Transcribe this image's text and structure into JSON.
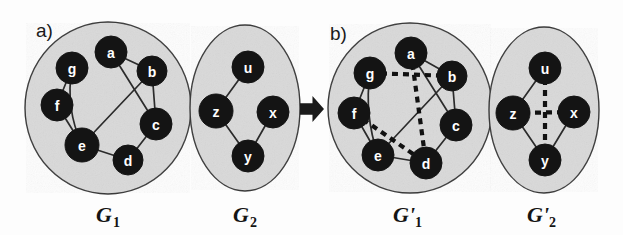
{
  "figure": {
    "panels": [
      {
        "id": "a",
        "letter": "a)"
      },
      {
        "id": "b",
        "letter": "b)"
      }
    ],
    "transition_arrow": "right-arrow",
    "colors": {
      "node_fill": "#141414",
      "node_label": "#ffffff",
      "container_fill": "#d9d9d9",
      "container_stroke": "#3a3a3a",
      "solid_edge": "#2b2b2b",
      "dashed_edge": "#111111",
      "background": "#fdfdfd"
    }
  },
  "graphs": [
    {
      "key": "G1",
      "label_main": "G",
      "label_sub": "1",
      "panel": "a",
      "container": {
        "cx": 108,
        "cy": 108,
        "rx": 83,
        "ry": 86
      },
      "label_pos": {
        "x": 96,
        "y": 222
      },
      "nodes": [
        {
          "id": "a",
          "x": 111,
          "y": 52,
          "r": 16
        },
        {
          "id": "b",
          "x": 152,
          "y": 71,
          "r": 15
        },
        {
          "id": "c",
          "x": 156,
          "y": 124,
          "r": 16
        },
        {
          "id": "d",
          "x": 128,
          "y": 160,
          "r": 15
        },
        {
          "id": "e",
          "x": 82,
          "y": 145,
          "r": 17
        },
        {
          "id": "f",
          "x": 57,
          "y": 105,
          "r": 16
        },
        {
          "id": "g",
          "x": 72,
          "y": 68,
          "r": 16
        }
      ],
      "edges": [
        {
          "from": "g",
          "to": "f",
          "style": "solid"
        },
        {
          "from": "g",
          "to": "e",
          "style": "solid",
          "curve": 12
        },
        {
          "from": "f",
          "to": "e",
          "style": "solid"
        },
        {
          "from": "a",
          "to": "b",
          "style": "solid"
        },
        {
          "from": "a",
          "to": "c",
          "style": "solid"
        },
        {
          "from": "b",
          "to": "c",
          "style": "solid"
        },
        {
          "from": "b",
          "to": "e",
          "style": "solid"
        },
        {
          "from": "c",
          "to": "d",
          "style": "solid"
        },
        {
          "from": "e",
          "to": "d",
          "style": "solid"
        }
      ]
    },
    {
      "key": "G2",
      "label_main": "G",
      "label_sub": "2",
      "panel": "a",
      "container": {
        "cx": 245,
        "cy": 108,
        "rx": 55,
        "ry": 83
      },
      "label_pos": {
        "x": 233,
        "y": 222
      },
      "nodes": [
        {
          "id": "u",
          "x": 248,
          "y": 67,
          "r": 16
        },
        {
          "id": "z",
          "x": 216,
          "y": 111,
          "r": 17
        },
        {
          "id": "x",
          "x": 273,
          "y": 112,
          "r": 16
        },
        {
          "id": "y",
          "x": 248,
          "y": 156,
          "r": 16
        }
      ],
      "edges": [
        {
          "from": "z",
          "to": "u",
          "style": "solid"
        },
        {
          "from": "z",
          "to": "y",
          "style": "solid"
        },
        {
          "from": "x",
          "to": "y",
          "style": "solid"
        }
      ]
    },
    {
      "key": "G1prime",
      "label_main": "G'",
      "label_sub": "1",
      "panel": "b",
      "container": {
        "cx": 410,
        "cy": 108,
        "rx": 82,
        "ry": 85
      },
      "label_pos": {
        "x": 393,
        "y": 222
      },
      "nodes": [
        {
          "id": "a",
          "x": 411,
          "y": 53,
          "r": 16
        },
        {
          "id": "b",
          "x": 452,
          "y": 76,
          "r": 15
        },
        {
          "id": "c",
          "x": 456,
          "y": 125,
          "r": 16
        },
        {
          "id": "d",
          "x": 426,
          "y": 163,
          "r": 16
        },
        {
          "id": "e",
          "x": 378,
          "y": 155,
          "r": 16
        },
        {
          "id": "f",
          "x": 354,
          "y": 113,
          "r": 16
        },
        {
          "id": "g",
          "x": 370,
          "y": 73,
          "r": 16
        }
      ],
      "edges": [
        {
          "from": "g",
          "to": "f",
          "style": "solid"
        },
        {
          "from": "g",
          "to": "e",
          "style": "solid",
          "curve": 10
        },
        {
          "from": "f",
          "to": "e",
          "style": "solid"
        },
        {
          "from": "a",
          "to": "b",
          "style": "solid"
        },
        {
          "from": "a",
          "to": "c",
          "style": "solid"
        },
        {
          "from": "b",
          "to": "c",
          "style": "solid"
        },
        {
          "from": "b",
          "to": "e",
          "style": "solid"
        },
        {
          "from": "c",
          "to": "d",
          "style": "solid"
        },
        {
          "from": "e",
          "to": "d",
          "style": "solid"
        },
        {
          "from": "g",
          "to": "b",
          "style": "dashed"
        },
        {
          "from": "a",
          "to": "d",
          "style": "dashed"
        },
        {
          "from": "f",
          "to": "d",
          "style": "dashed"
        }
      ]
    },
    {
      "key": "G2prime",
      "label_main": "G'",
      "label_sub": "2",
      "panel": "b",
      "container": {
        "cx": 544,
        "cy": 110,
        "rx": 55,
        "ry": 83
      },
      "label_pos": {
        "x": 527,
        "y": 222
      },
      "nodes": [
        {
          "id": "u",
          "x": 545,
          "y": 68,
          "r": 16
        },
        {
          "id": "z",
          "x": 513,
          "y": 113,
          "r": 17
        },
        {
          "id": "x",
          "x": 574,
          "y": 112,
          "r": 16
        },
        {
          "id": "y",
          "x": 545,
          "y": 160,
          "r": 16
        }
      ],
      "edges": [
        {
          "from": "z",
          "to": "u",
          "style": "solid"
        },
        {
          "from": "z",
          "to": "y",
          "style": "solid"
        },
        {
          "from": "x",
          "to": "y",
          "style": "solid"
        },
        {
          "from": "u",
          "to": "y",
          "style": "dashed"
        },
        {
          "from": "z",
          "to": "x",
          "style": "dashed"
        }
      ]
    }
  ],
  "annotations": {
    "panel_a_letter_pos": {
      "x": 36,
      "y": 37
    },
    "panel_b_letter_pos": {
      "x": 330,
      "y": 40
    },
    "arrow_pos": {
      "x": 300,
      "y": 96,
      "w": 24,
      "h": 26
    }
  }
}
